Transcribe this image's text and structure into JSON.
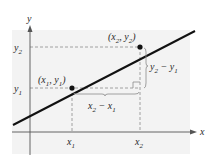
{
  "figure": {
    "axis_x_label": "x",
    "axis_y_label": "y",
    "point1": {
      "label": "(x",
      "sub1": "1",
      "mid": ", y",
      "sub2": "1",
      "end": ")"
    },
    "point2": {
      "label": "(x",
      "sub1": "2",
      "mid": ", y",
      "sub2": "2",
      "end": ")"
    },
    "tick_x1": {
      "base": "x",
      "sub": "1"
    },
    "tick_x2": {
      "base": "x",
      "sub": "2"
    },
    "tick_y1": {
      "base": "y",
      "sub": "1"
    },
    "tick_y2": {
      "base": "y",
      "sub": "2"
    },
    "rise_label": {
      "a": "y",
      "a_sub": "2",
      "op": " − ",
      "b": "y",
      "b_sub": "1"
    },
    "run_label": {
      "a": "x",
      "a_sub": "2",
      "op": " − ",
      "b": "x",
      "b_sub": "1"
    }
  },
  "colors": {
    "panel": "#f3f3f3",
    "line": "#111111",
    "dashed": "#8a8a8a",
    "axis": "#555555",
    "text": "#2a2a2a"
  }
}
